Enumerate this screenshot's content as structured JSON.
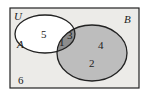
{
  "universe": {
    "label": "U",
    "fill": "#ecebe8"
  },
  "sets": [
    {
      "label": "A",
      "fill": "#ffffff"
    },
    {
      "label": "B",
      "fill": "#bdbdbd"
    }
  ],
  "intersection_fill": "#8c8c8c",
  "regions": {
    "a_only": "5",
    "a_and_b_1": "1",
    "a_and_b_2": "3",
    "b_only_1": "4",
    "b_only_2": "2",
    "outside": "6"
  }
}
